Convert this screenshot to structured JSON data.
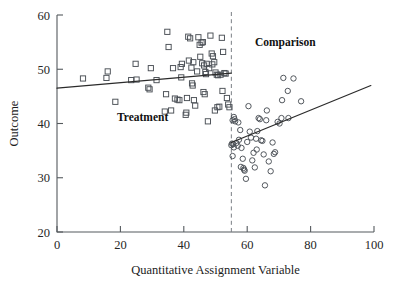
{
  "chart_data": {
    "type": "scatter",
    "title": "",
    "xlabel": "Quantitative Assignment Variable",
    "ylabel": "Outcome",
    "xlim": [
      0,
      100
    ],
    "ylim": [
      20,
      60
    ],
    "xticks": [
      0,
      20,
      40,
      60,
      80,
      100
    ],
    "yticks": [
      20,
      30,
      40,
      50,
      60
    ],
    "grid": false,
    "legend_position": "none",
    "cutoff": 55,
    "annotations": [
      {
        "name": "treatment-label",
        "text": "Treatment",
        "x": 27,
        "y": 40.5
      },
      {
        "name": "comparison-label",
        "text": "Comparison",
        "x": 72,
        "y": 54.2
      }
    ],
    "series": [
      {
        "name": "Treatment",
        "marker": "square",
        "points": [
          [
            8.2,
            48.3
          ],
          [
            15.6,
            48.4
          ],
          [
            16.0,
            49.6
          ],
          [
            18.4,
            44.0
          ],
          [
            23.4,
            48.0
          ],
          [
            25.1,
            48.1
          ],
          [
            24.8,
            51.0
          ],
          [
            28.8,
            46.6
          ],
          [
            29.2,
            46.3
          ],
          [
            29.6,
            50.2
          ],
          [
            31.4,
            48.0
          ],
          [
            34.8,
            56.9
          ],
          [
            35.2,
            54.1
          ],
          [
            34.4,
            45.4
          ],
          [
            34.0,
            42.2
          ],
          [
            37.2,
            44.6
          ],
          [
            38.6,
            44.3
          ],
          [
            39.0,
            50.4
          ],
          [
            39.4,
            51.0
          ],
          [
            39.2,
            48.5
          ],
          [
            40.6,
            41.6
          ],
          [
            40.8,
            42.0
          ],
          [
            41.4,
            56.0
          ],
          [
            42.0,
            55.7
          ],
          [
            41.6,
            51.6
          ],
          [
            42.4,
            50.3
          ],
          [
            42.6,
            47.4
          ],
          [
            42.8,
            47.0
          ],
          [
            43.2,
            44.3
          ],
          [
            43.6,
            43.3
          ],
          [
            44.6,
            55.9
          ],
          [
            45.0,
            54.5
          ],
          [
            45.6,
            54.9
          ],
          [
            46.0,
            55.0
          ],
          [
            45.2,
            52.3
          ],
          [
            45.8,
            51.1
          ],
          [
            46.4,
            50.7
          ],
          [
            46.8,
            49.5
          ],
          [
            47.0,
            49.1
          ],
          [
            46.2,
            45.8
          ],
          [
            46.6,
            45.4
          ],
          [
            47.6,
            40.4
          ],
          [
            48.4,
            56.2
          ],
          [
            48.8,
            52.9
          ],
          [
            49.2,
            52.4
          ],
          [
            49.6,
            51.3
          ],
          [
            49.0,
            50.9
          ],
          [
            50.0,
            49.4
          ],
          [
            50.4,
            49.0
          ],
          [
            50.8,
            48.9
          ],
          [
            49.8,
            42.4
          ],
          [
            50.6,
            43.0
          ],
          [
            51.2,
            43.1
          ],
          [
            52.0,
            55.8
          ],
          [
            52.4,
            53.2
          ],
          [
            52.8,
            49.3
          ],
          [
            53.2,
            49.2
          ],
          [
            52.2,
            46.0
          ],
          [
            53.6,
            44.7
          ],
          [
            54.0,
            43.5
          ],
          [
            54.4,
            43.0
          ],
          [
            36.6,
            50.2
          ],
          [
            43.0,
            51.3
          ],
          [
            47.2,
            51.0
          ],
          [
            48.0,
            50.2
          ],
          [
            51.6,
            49.0
          ],
          [
            44.2,
            49.6
          ],
          [
            41.0,
            44.7
          ],
          [
            38.0,
            44.4
          ],
          [
            36.0,
            42.4
          ]
        ]
      },
      {
        "name": "Comparison",
        "marker": "circle",
        "points": [
          [
            55.4,
            40.6
          ],
          [
            55.8,
            41.2
          ],
          [
            56.0,
            40.8
          ],
          [
            56.2,
            40.4
          ],
          [
            55.2,
            36.3
          ],
          [
            55.6,
            36.2
          ],
          [
            55.0,
            36.0
          ],
          [
            55.8,
            35.6
          ],
          [
            55.4,
            34.0
          ],
          [
            57.0,
            35.9
          ],
          [
            57.4,
            37.0
          ],
          [
            57.8,
            38.8
          ],
          [
            58.2,
            35.5
          ],
          [
            58.6,
            33.5
          ],
          [
            58.8,
            31.8
          ],
          [
            59.0,
            31.5
          ],
          [
            59.2,
            31.3
          ],
          [
            59.6,
            29.8
          ],
          [
            60.4,
            43.2
          ],
          [
            60.8,
            38.5
          ],
          [
            61.2,
            37.4
          ],
          [
            61.6,
            33.2
          ],
          [
            62.0,
            34.6
          ],
          [
            62.4,
            31.9
          ],
          [
            62.8,
            37.2
          ],
          [
            63.2,
            38.6
          ],
          [
            63.6,
            41.0
          ],
          [
            64.0,
            40.8
          ],
          [
            64.4,
            36.9
          ],
          [
            64.8,
            36.8
          ],
          [
            65.2,
            34.3
          ],
          [
            65.6,
            28.6
          ],
          [
            66.2,
            42.4
          ],
          [
            66.8,
            33.0
          ],
          [
            67.4,
            31.2
          ],
          [
            68.0,
            36.5
          ],
          [
            68.4,
            34.4
          ],
          [
            68.8,
            34.7
          ],
          [
            69.6,
            40.3
          ],
          [
            70.2,
            40.0
          ],
          [
            70.8,
            41.0
          ],
          [
            71.4,
            48.4
          ],
          [
            72.8,
            46.0
          ],
          [
            73.0,
            41.0
          ],
          [
            74.6,
            48.3
          ],
          [
            77.0,
            44.1
          ],
          [
            66.0,
            40.6
          ],
          [
            60.0,
            36.6
          ],
          [
            57.2,
            40.2
          ],
          [
            56.6,
            36.4
          ],
          [
            58.0,
            32.0
          ],
          [
            63.0,
            35.2
          ],
          [
            71.0,
            44.3
          ]
        ]
      }
    ],
    "fit_lines": [
      {
        "name": "treatment-fit",
        "group": "Treatment",
        "x1": 0,
        "y1": 46.5,
        "x2": 55,
        "y2": 49.3
      },
      {
        "name": "comparison-fit",
        "group": "Comparison",
        "x1": 55,
        "y1": 36.5,
        "x2": 99,
        "y2": 47.0
      }
    ],
    "cutoff_line": {
      "name": "cutoff-line",
      "x": 55,
      "style": "dashed"
    }
  }
}
